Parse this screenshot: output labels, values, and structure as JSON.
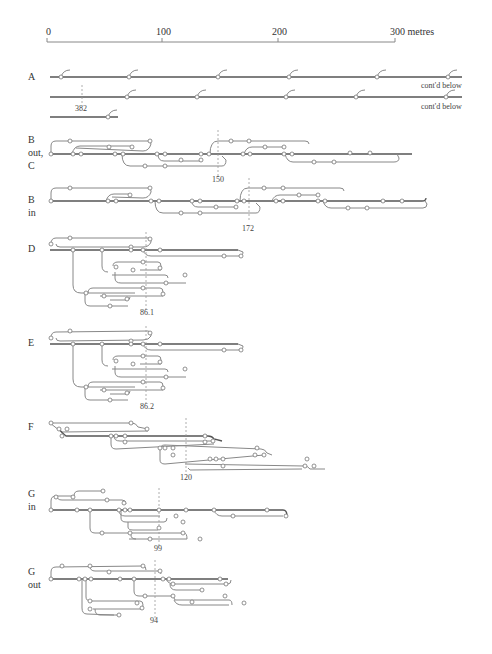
{
  "scale": {
    "ticks": [
      {
        "label": "0",
        "x": 47
      },
      {
        "label": "100",
        "x": 162
      },
      {
        "label": "200",
        "x": 278
      },
      {
        "label": "300 metres",
        "x": 395
      }
    ]
  },
  "sections": [
    {
      "id": "A",
      "label_lines": [
        "A"
      ],
      "annotations": [
        "382",
        "cont'd below",
        "cont'd below"
      ]
    },
    {
      "id": "B-out-C",
      "label_lines": [
        "B",
        "out,",
        "C"
      ],
      "marker": "150"
    },
    {
      "id": "B-in",
      "label_lines": [
        "B",
        "in"
      ],
      "marker": "172"
    },
    {
      "id": "D",
      "label_lines": [
        "D"
      ],
      "marker": "86.1"
    },
    {
      "id": "E",
      "label_lines": [
        "E"
      ],
      "marker": "86.2"
    },
    {
      "id": "F",
      "label_lines": [
        "F"
      ],
      "marker": "120"
    },
    {
      "id": "G-in",
      "label_lines": [
        "G",
        "in"
      ],
      "marker": "99"
    },
    {
      "id": "G-out",
      "label_lines": [
        "G",
        "out"
      ],
      "marker": "94"
    }
  ],
  "labels": {
    "a": "A",
    "a_marker": "382",
    "a_contd_1": "cont'd below",
    "a_contd_2": "cont'd below",
    "b_out_1": "B",
    "b_out_2": "out,",
    "b_out_3": "C",
    "b_out_marker": "150",
    "b_in_1": "B",
    "b_in_2": "in",
    "b_in_marker": "172",
    "d": "D",
    "d_marker": "86.1",
    "e": "E",
    "e_marker": "86.2",
    "f": "F",
    "f_marker": "120",
    "g_in_1": "G",
    "g_in_2": "in",
    "g_in_marker": "99",
    "g_out_1": "G",
    "g_out_2": "out",
    "g_out_marker": "94"
  }
}
